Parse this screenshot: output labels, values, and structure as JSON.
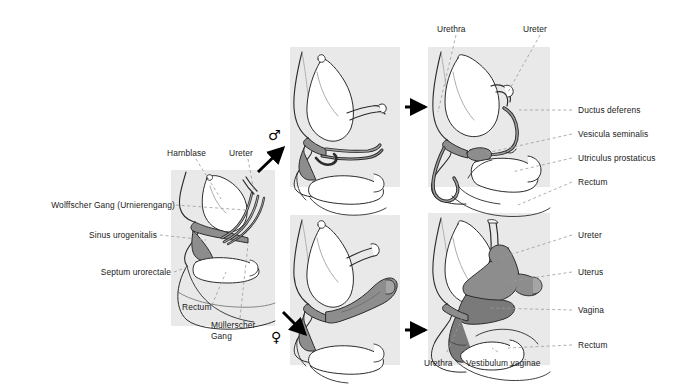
{
  "figure": {
    "panel_bg": "#e9e9e9",
    "organ_shade": "#8d8d8d",
    "organ_shade_dark": "#7a7a7a",
    "outline": "#2b2b2b",
    "leader_color": "#9a9a9a",
    "arrow_color": "#000000",
    "text_color": "#1a1a1a"
  },
  "panels": {
    "indifferent": {
      "name": "indifferent-stage-panel"
    },
    "male_mid": {
      "name": "male-intermediate-panel"
    },
    "male_final": {
      "name": "male-final-panel"
    },
    "female_mid": {
      "name": "female-intermediate-panel"
    },
    "female_final": {
      "name": "female-final-panel"
    }
  },
  "symbols": {
    "male": "♂",
    "female": "♀"
  },
  "labels": {
    "indifferent": [
      {
        "id": "harnblase",
        "text": "Harnblase"
      },
      {
        "id": "ureter",
        "text": "Ureter"
      },
      {
        "id": "wolffscher_gang",
        "text": "Wolffscher Gang (Urnierengang)"
      },
      {
        "id": "sinus_urogenitalis",
        "text": "Sinus urogenitalis"
      },
      {
        "id": "septum_urorectale",
        "text": "Septum urorectale"
      },
      {
        "id": "rectum",
        "text": "Rectum"
      },
      {
        "id": "muellerscher_gang",
        "text": "Müllerscher Gang"
      }
    ],
    "male": [
      {
        "id": "urethra",
        "text": "Urethra"
      },
      {
        "id": "ureter",
        "text": "Ureter"
      },
      {
        "id": "ductus_deferens",
        "text": "Ductus deferens"
      },
      {
        "id": "vesicula_seminalis",
        "text": "Vesicula seminalis"
      },
      {
        "id": "utriculus_prostaticus",
        "text": "Utriculus prostaticus"
      },
      {
        "id": "rectum",
        "text": "Rectum"
      }
    ],
    "female": [
      {
        "id": "ureter",
        "text": "Ureter"
      },
      {
        "id": "uterus",
        "text": "Uterus"
      },
      {
        "id": "vagina",
        "text": "Vagina"
      },
      {
        "id": "rectum",
        "text": "Rectum"
      },
      {
        "id": "urethra",
        "text": "Urethra"
      },
      {
        "id": "vestibulum_vaginae",
        "text": "Vestibulum vaginae"
      }
    ]
  },
  "label_text": {
    "harnblase": "Harnblase",
    "ureter_left": "Ureter",
    "wolffscher_gang": "Wolffscher Gang (Urnierengang)",
    "sinus_urogenitalis": "Sinus urogenitalis",
    "septum_urorectale": "Septum urorectale",
    "rectum_left": "Rectum",
    "muellerscher_gang_l1": "Müllerscher",
    "muellerscher_gang_l2": "Gang",
    "urethra_top": "Urethra",
    "ureter_top": "Ureter",
    "ductus_deferens": "Ductus deferens",
    "vesicula_seminalis": "Vesicula seminalis",
    "utriculus_prostaticus": "Utriculus prostaticus",
    "rectum_male": "Rectum",
    "ureter_female": "Ureter",
    "uterus": "Uterus",
    "vagina": "Vagina",
    "rectum_female": "Rectum",
    "urethra_bottom": "Urethra",
    "vestibulum_vaginae": "Vestibulum vaginae",
    "male_symbol": "♂",
    "female_symbol": "♀"
  }
}
